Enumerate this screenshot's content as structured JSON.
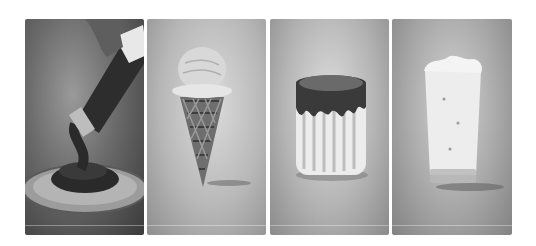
{
  "gallery": {
    "layout": "four-panel grayscale product photo strip",
    "panels": [
      {
        "subject": "hand squeezing bottle pouring thick sauce onto plate",
        "tone": "dark"
      },
      {
        "subject": "single ice cream scoop in waffle cone",
        "tone": "light"
      },
      {
        "subject": "caramel-topped pudding with drips",
        "tone": "light"
      },
      {
        "subject": "frothy milkshake in tall glass",
        "tone": "light"
      }
    ]
  }
}
